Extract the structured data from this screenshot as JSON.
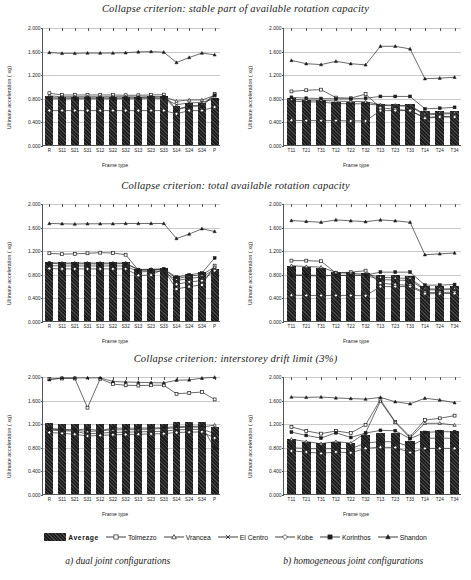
{
  "rows": [
    {
      "title": "Collapse criterion: stable part of available rotation capacity"
    },
    {
      "title": "Collapse criterion: total available rotation capacity"
    },
    {
      "title": "Collapse criterion: interstorey drift limit (3%)"
    }
  ],
  "axes": {
    "ylabel": "Ultimate acceleration ( xg)",
    "xlabel": "Frame type",
    "yticks": [
      "0.000",
      "0.400",
      "0.800",
      "1.200",
      "1.600",
      "2.000"
    ],
    "ymin": 0,
    "ymax": 2.0
  },
  "legend": {
    "items": [
      {
        "label": "Average",
        "marker": "bar",
        "color": "#1c1c1c"
      },
      {
        "label": "Tolmezzo",
        "marker": "open-square",
        "color": "#333333"
      },
      {
        "label": "Vrancea",
        "marker": "open-triangle",
        "color": "#333333"
      },
      {
        "label": "El Centro",
        "marker": "cross-x",
        "color": "#333333"
      },
      {
        "label": "Kobe",
        "marker": "open-diamond",
        "color": "#333333"
      },
      {
        "label": "Korinthos",
        "marker": "filled-square",
        "color": "#1c1c1c"
      },
      {
        "label": "Shandon",
        "marker": "filled-triangle",
        "color": "#1c1c1c"
      }
    ]
  },
  "captions": [
    "a) dual joint configurations",
    "b) homogeneous joint configurations"
  ],
  "chart_data": [
    {
      "id": "stable-dual",
      "type": "bar",
      "title": "Collapse criterion: stable part of available rotation capacity",
      "xlabel": "Frame type",
      "ylabel": "Ultimate acceleration ( xg)",
      "ylim": [
        0,
        2.0
      ],
      "yticks": [
        0,
        0.4,
        0.8,
        1.2,
        1.6,
        2.0
      ],
      "grid": true,
      "legend": "bottom",
      "categories": [
        "R",
        "S11",
        "S21",
        "S31",
        "S12",
        "S22",
        "S32",
        "S13",
        "S23",
        "S33",
        "S14",
        "S24",
        "S34",
        "P"
      ],
      "values": [
        0.83,
        0.82,
        0.82,
        0.82,
        0.82,
        0.82,
        0.82,
        0.82,
        0.825,
        0.825,
        0.66,
        0.71,
        0.72,
        0.79
      ],
      "series": [
        {
          "name": "Tolmezzo",
          "marker": "open-square",
          "values": [
            0.895,
            0.865,
            0.865,
            0.865,
            0.865,
            0.865,
            0.86,
            0.86,
            0.865,
            0.87,
            0.62,
            0.68,
            0.69,
            0.88
          ]
        },
        {
          "name": "Vrancea",
          "marker": "open-triangle",
          "values": [
            0.85,
            0.835,
            0.835,
            0.835,
            0.835,
            0.835,
            0.835,
            0.83,
            0.835,
            0.835,
            0.76,
            0.78,
            0.78,
            0.855
          ]
        },
        {
          "name": "El Centro",
          "marker": "cross-x",
          "values": [
            0.8,
            0.8,
            0.8,
            0.8,
            0.8,
            0.8,
            0.8,
            0.8,
            0.805,
            0.805,
            0.7,
            0.73,
            0.74,
            0.8
          ]
        },
        {
          "name": "Kobe",
          "marker": "open-diamond",
          "values": [
            0.6,
            0.6,
            0.6,
            0.6,
            0.6,
            0.6,
            0.6,
            0.6,
            0.6,
            0.6,
            0.545,
            0.6,
            0.6,
            0.66
          ]
        },
        {
          "name": "Korinthos",
          "marker": "filled-square",
          "values": [
            0.82,
            0.815,
            0.815,
            0.815,
            0.815,
            0.815,
            0.815,
            0.82,
            0.825,
            0.83,
            0.61,
            0.67,
            0.68,
            0.86
          ]
        },
        {
          "name": "Shandon",
          "marker": "filled-triangle",
          "values": [
            1.585,
            1.57,
            1.57,
            1.575,
            1.575,
            1.575,
            1.58,
            1.595,
            1.6,
            1.59,
            1.415,
            1.5,
            1.575,
            1.545
          ]
        }
      ]
    },
    {
      "id": "stable-homogeneous",
      "type": "bar",
      "title": "Collapse criterion: stable part of available rotation capacity",
      "xlabel": "Frame type",
      "ylabel": "Ultimate acceleration ( xg)",
      "ylim": [
        0,
        2.0
      ],
      "yticks": [
        0,
        0.4,
        0.8,
        1.2,
        1.6,
        2.0
      ],
      "grid": true,
      "legend": "bottom",
      "categories": [
        "T11",
        "T21",
        "T31",
        "T12",
        "T22",
        "T32",
        "T13",
        "T23",
        "T33",
        "T14",
        "T24",
        "T34"
      ],
      "values": [
        0.79,
        0.77,
        0.765,
        0.73,
        0.725,
        0.725,
        0.7,
        0.7,
        0.7,
        0.57,
        0.58,
        0.58
      ],
      "series": [
        {
          "name": "Tolmezzo",
          "marker": "open-square",
          "values": [
            0.925,
            0.945,
            0.955,
            0.82,
            0.81,
            0.88,
            0.65,
            0.62,
            0.6,
            0.48,
            0.5,
            0.5
          ]
        },
        {
          "name": "Vrancea",
          "marker": "open-triangle",
          "values": [
            0.79,
            0.78,
            0.775,
            0.76,
            0.755,
            0.75,
            0.7,
            0.69,
            0.685,
            0.54,
            0.56,
            0.56
          ]
        },
        {
          "name": "El Centro",
          "marker": "cross-x",
          "values": [
            0.76,
            0.75,
            0.745,
            0.72,
            0.715,
            0.715,
            0.69,
            0.68,
            0.675,
            0.52,
            0.545,
            0.545
          ]
        },
        {
          "name": "Kobe",
          "marker": "open-diamond",
          "values": [
            0.435,
            0.43,
            0.43,
            0.43,
            0.425,
            0.425,
            0.6,
            0.6,
            0.6,
            0.47,
            0.49,
            0.49
          ]
        },
        {
          "name": "Korinthos",
          "marker": "filled-square",
          "values": [
            0.825,
            0.81,
            0.805,
            0.8,
            0.8,
            0.81,
            0.84,
            0.84,
            0.84,
            0.63,
            0.64,
            0.655
          ]
        },
        {
          "name": "Shandon",
          "marker": "filled-triangle",
          "values": [
            1.45,
            1.395,
            1.38,
            1.435,
            1.395,
            1.375,
            1.69,
            1.69,
            1.645,
            1.14,
            1.15,
            1.165
          ]
        }
      ]
    },
    {
      "id": "total-dual",
      "type": "bar",
      "title": "Collapse criterion: total available rotation capacity",
      "xlabel": "Frame type",
      "ylabel": "Ultimate acceleration ( xg)",
      "ylim": [
        0,
        2.0
      ],
      "yticks": [
        0,
        0.4,
        0.8,
        1.2,
        1.6,
        2.0
      ],
      "grid": true,
      "legend": "bottom",
      "categories": [
        "R",
        "S11",
        "S21",
        "S31",
        "S12",
        "S22",
        "S32",
        "S13",
        "S23",
        "S33",
        "S14",
        "S24",
        "S34",
        "P"
      ],
      "values": [
        1.0,
        1.0,
        1.0,
        1.0,
        1.0,
        1.0,
        1.0,
        0.885,
        0.89,
        0.895,
        0.77,
        0.8,
        0.83,
        0.88
      ],
      "series": [
        {
          "name": "Tolmezzo",
          "marker": "open-square",
          "values": [
            1.165,
            1.15,
            1.155,
            1.165,
            1.175,
            1.17,
            1.14,
            0.88,
            0.88,
            0.885,
            0.56,
            0.6,
            0.63,
            0.955
          ]
        },
        {
          "name": "Vrancea",
          "marker": "open-triangle",
          "values": [
            1.005,
            1.0,
            1.0,
            1.0,
            1.0,
            1.0,
            1.0,
            0.89,
            0.895,
            0.9,
            0.73,
            0.78,
            0.8,
            0.93
          ]
        },
        {
          "name": "El Centro",
          "marker": "cross-x",
          "values": [
            0.955,
            0.95,
            0.95,
            0.95,
            0.95,
            0.95,
            0.95,
            0.85,
            0.855,
            0.86,
            0.7,
            0.74,
            0.76,
            0.895
          ]
        },
        {
          "name": "Kobe",
          "marker": "open-diamond",
          "values": [
            0.905,
            0.9,
            0.9,
            0.9,
            0.9,
            0.9,
            0.9,
            0.79,
            0.795,
            0.9,
            0.64,
            0.68,
            0.7,
            0.87
          ]
        },
        {
          "name": "Korinthos",
          "marker": "filled-square",
          "values": [
            0.995,
            0.985,
            0.985,
            0.985,
            0.985,
            0.985,
            0.99,
            0.88,
            0.885,
            0.895,
            0.76,
            0.8,
            0.83,
            1.085
          ]
        },
        {
          "name": "Shandon",
          "marker": "filled-triangle",
          "values": [
            1.67,
            1.665,
            1.66,
            1.665,
            1.665,
            1.665,
            1.67,
            1.67,
            1.67,
            1.67,
            1.415,
            1.49,
            1.58,
            1.535
          ]
        }
      ]
    },
    {
      "id": "total-homogeneous",
      "type": "bar",
      "title": "Collapse criterion: total available rotation capacity",
      "xlabel": "Frame type",
      "ylabel": "Ultimate acceleration ( xg)",
      "ylim": [
        0,
        2.0
      ],
      "yticks": [
        0,
        0.4,
        0.8,
        1.2,
        1.6,
        2.0
      ],
      "grid": true,
      "legend": "bottom",
      "categories": [
        "T11",
        "T21",
        "T31",
        "T12",
        "T22",
        "T32",
        "T13",
        "T23",
        "T33",
        "T14",
        "T24",
        "T34"
      ],
      "values": [
        0.93,
        0.91,
        0.9,
        0.83,
        0.825,
        0.82,
        0.775,
        0.775,
        0.77,
        0.6,
        0.595,
        0.6
      ],
      "series": [
        {
          "name": "Tolmezzo",
          "marker": "open-square",
          "values": [
            1.04,
            1.04,
            1.03,
            0.83,
            0.845,
            0.87,
            0.66,
            0.635,
            0.62,
            0.5,
            0.5,
            0.505
          ]
        },
        {
          "name": "Vrancea",
          "marker": "open-triangle",
          "values": [
            0.955,
            0.94,
            0.93,
            0.84,
            0.825,
            0.81,
            0.76,
            0.745,
            0.74,
            0.56,
            0.56,
            0.565
          ]
        },
        {
          "name": "El Centro",
          "marker": "cross-x",
          "values": [
            0.8,
            0.795,
            0.79,
            0.79,
            0.79,
            0.79,
            0.72,
            0.71,
            0.705,
            0.545,
            0.545,
            0.55
          ]
        },
        {
          "name": "Kobe",
          "marker": "open-diamond",
          "values": [
            0.455,
            0.45,
            0.45,
            0.45,
            0.45,
            0.445,
            0.6,
            0.6,
            0.6,
            0.48,
            0.48,
            0.485
          ]
        },
        {
          "name": "Korinthos",
          "marker": "filled-square",
          "values": [
            0.79,
            0.785,
            0.78,
            0.79,
            0.79,
            0.795,
            0.845,
            0.845,
            0.845,
            0.625,
            0.625,
            0.635
          ]
        },
        {
          "name": "Shandon",
          "marker": "filled-triangle",
          "values": [
            1.72,
            1.705,
            1.69,
            1.73,
            1.715,
            1.7,
            1.73,
            1.715,
            1.69,
            1.14,
            1.155,
            1.17
          ]
        }
      ]
    },
    {
      "id": "drift-dual",
      "type": "bar",
      "title": "Collapse criterion: interstorey drift limit (3%)",
      "xlabel": "Frame type",
      "ylabel": "Ultimate acceleration ( xg)",
      "ylim": [
        0,
        2.0
      ],
      "yticks": [
        0,
        0.4,
        0.8,
        1.2,
        1.6,
        2.0
      ],
      "grid": true,
      "legend": "bottom",
      "categories": [
        "R",
        "S11",
        "S21",
        "S31",
        "S12",
        "S22",
        "S32",
        "S13",
        "S23",
        "S33",
        "S14",
        "S24",
        "S34",
        "P"
      ],
      "values": [
        1.2,
        1.18,
        1.18,
        1.18,
        1.18,
        1.185,
        1.185,
        1.185,
        1.185,
        1.19,
        1.215,
        1.215,
        1.215,
        1.13
      ],
      "series": [
        {
          "name": "Tolmezzo",
          "marker": "open-square",
          "values": [
            1.965,
            1.975,
            1.975,
            1.48,
            1.97,
            1.88,
            1.86,
            1.855,
            1.86,
            1.86,
            1.715,
            1.73,
            1.745,
            1.62
          ]
        },
        {
          "name": "Vrancea",
          "marker": "open-triangle",
          "values": [
            1.125,
            1.115,
            1.1,
            1.075,
            1.09,
            1.105,
            1.105,
            1.11,
            1.12,
            1.125,
            1.14,
            1.15,
            1.15,
            1.185
          ]
        },
        {
          "name": "El Centro",
          "marker": "cross-x",
          "values": [
            1.1,
            1.09,
            1.08,
            1.035,
            1.05,
            1.06,
            1.065,
            1.07,
            1.075,
            1.08,
            1.105,
            1.11,
            1.115,
            1.04
          ]
        },
        {
          "name": "Kobe",
          "marker": "open-diamond",
          "values": [
            1.06,
            1.045,
            1.03,
            1.0,
            1.01,
            1.02,
            1.025,
            1.03,
            1.035,
            1.04,
            1.06,
            1.065,
            1.07,
            0.965
          ]
        },
        {
          "name": "Korinthos",
          "marker": "filled-square",
          "values": [
            1.12,
            1.105,
            1.1,
            1.12,
            1.09,
            1.135,
            1.13,
            1.135,
            1.135,
            1.14,
            1.16,
            1.165,
            1.165,
            0.79
          ]
        },
        {
          "name": "Shandon",
          "marker": "filled-triangle",
          "values": [
            1.955,
            1.985,
            1.985,
            1.985,
            1.985,
            1.925,
            1.915,
            1.91,
            1.905,
            1.9,
            1.945,
            1.95,
            1.98,
            1.995
          ]
        }
      ]
    },
    {
      "id": "drift-homogeneous",
      "type": "bar",
      "title": "Collapse criterion: interstorey drift limit (3%)",
      "xlabel": "Frame type",
      "ylabel": "Ultimate acceleration ( xg)",
      "ylim": [
        0,
        2.0
      ],
      "yticks": [
        0,
        0.4,
        0.8,
        1.2,
        1.6,
        2.0
      ],
      "grid": true,
      "legend": "bottom",
      "categories": [
        "T11",
        "T21",
        "T31",
        "T12",
        "T22",
        "T32",
        "T13",
        "T23",
        "T33",
        "T14",
        "T24",
        "T34"
      ],
      "values": [
        0.935,
        0.89,
        0.86,
        0.89,
        0.865,
        1.0,
        1.04,
        1.04,
        0.905,
        1.07,
        1.08,
        1.075
      ],
      "series": [
        {
          "name": "Tolmezzo",
          "marker": "open-square",
          "values": [
            1.155,
            1.085,
            1.04,
            1.085,
            1.05,
            1.19,
            1.615,
            1.24,
            0.99,
            1.27,
            1.3,
            1.345
          ]
        },
        {
          "name": "Vrancea",
          "marker": "open-triangle",
          "values": [
            0.945,
            0.905,
            0.87,
            0.905,
            0.88,
            1.055,
            1.59,
            1.23,
            0.965,
            1.215,
            1.215,
            1.185
          ]
        },
        {
          "name": "El Centro",
          "marker": "cross-x",
          "values": [
            0.8,
            0.79,
            0.78,
            0.79,
            0.785,
            0.88,
            0.905,
            0.9,
            0.82,
            0.96,
            0.965,
            0.96
          ]
        },
        {
          "name": "Kobe",
          "marker": "open-diamond",
          "values": [
            0.745,
            0.73,
            0.705,
            0.73,
            0.715,
            0.79,
            0.81,
            0.805,
            0.72,
            0.79,
            0.79,
            0.79
          ]
        },
        {
          "name": "Korinthos",
          "marker": "filled-square",
          "values": [
            1.065,
            1.01,
            0.965,
            1.055,
            0.975,
            1.05,
            1.095,
            1.09,
            0.955,
            1.06,
            1.075,
            1.07
          ]
        },
        {
          "name": "Shandon",
          "marker": "filled-triangle",
          "values": [
            1.66,
            1.655,
            1.66,
            1.645,
            1.635,
            1.625,
            1.655,
            1.58,
            1.545,
            1.64,
            1.61,
            1.565
          ]
        }
      ]
    }
  ]
}
